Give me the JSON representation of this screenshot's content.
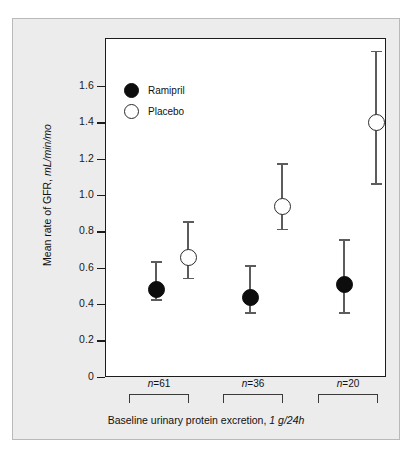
{
  "chart_data": {
    "type": "scatter",
    "title": "",
    "xlabel": "Baseline urinary protein excretion, 1 g/24h",
    "xlabel_main": "Baseline urinary protein excretion,",
    "xlabel_units": "1 g/24h",
    "ylabel": "Mean rate of GFR, mL/min/mo",
    "ylabel_main": "Mean rate of GFR,",
    "ylabel_units": "mL/min/mo",
    "ylim": [
      0,
      1.8
    ],
    "yticks": [
      "0",
      "0.2",
      "0.4",
      "0.6",
      "0.8",
      "1.0",
      "1.2",
      "1.4",
      "1.6"
    ],
    "ytick_values": [
      0,
      0.2,
      0.4,
      0.6,
      0.8,
      1.0,
      1.2,
      1.4,
      1.6
    ],
    "grid": false,
    "legend_position": "top-left",
    "categories": [
      "n=61",
      "n=36",
      "n=20"
    ],
    "category_n": [
      61,
      36,
      20
    ],
    "series": [
      {
        "name": "Ramipril",
        "marker": "filled-circle",
        "color": "#0d0d0d",
        "values": [
          0.53,
          0.49,
          0.56
        ],
        "err_low": [
          0.43,
          0.36,
          0.36
        ],
        "err_high": [
          0.64,
          0.62,
          0.76
        ]
      },
      {
        "name": "Placebo",
        "marker": "open-circle",
        "color": "#ffffff",
        "values": [
          0.71,
          0.99,
          1.45
        ],
        "err_low": [
          0.55,
          0.82,
          1.07
        ],
        "err_high": [
          0.86,
          1.18,
          1.8
        ]
      }
    ]
  },
  "legend": {
    "items": [
      {
        "label": "Ramipril",
        "marker": "filled-circle"
      },
      {
        "label": "Placebo",
        "marker": "open-circle"
      }
    ]
  },
  "axes": {
    "y": {
      "ticks": [
        {
          "label": "1.6",
          "value": 1.6
        },
        {
          "label": "1.4",
          "value": 1.4
        },
        {
          "label": "1.2",
          "value": 1.2
        },
        {
          "label": "1.0",
          "value": 1.0
        },
        {
          "label": "0.8",
          "value": 0.8
        },
        {
          "label": "0.6",
          "value": 0.6
        },
        {
          "label": "0.4",
          "value": 0.4
        },
        {
          "label": "0.2",
          "value": 0.2
        },
        {
          "label": "0",
          "value": 0
        }
      ],
      "title_main": "Mean rate of GFR,",
      "title_units": "mL/min/mo"
    },
    "x": {
      "groups": [
        {
          "label_prefix": "n",
          "label_rest": "=61"
        },
        {
          "label_prefix": "n",
          "label_rest": "=36"
        },
        {
          "label_prefix": "n",
          "label_rest": "=20"
        }
      ],
      "caption_main": "Baseline urinary protein excretion,",
      "caption_units": "1 g/24h"
    }
  },
  "colors": {
    "panel_background": "#ececec",
    "plot_background": "#ffffff",
    "axis": "#1c1c1c",
    "errorbar": "#5c5c5c",
    "ramipril": "#0d0d0d",
    "placebo": "#ffffff"
  }
}
